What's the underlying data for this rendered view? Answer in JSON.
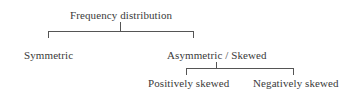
{
  "diagram": {
    "type": "tree",
    "root": {
      "label": "Frequency distribution",
      "children": [
        {
          "label": "Symmetric"
        },
        {
          "label": "Asymmetric / Skewed",
          "children": [
            {
              "label": "Positively skewed"
            },
            {
              "label": "Negatively skewed"
            }
          ]
        }
      ]
    }
  },
  "labels": {
    "root": "Frequency distribution",
    "symmetric": "Symmetric",
    "asymmetric": "Asymmetric / Skewed",
    "positive": "Positively skewed",
    "negative": "Negatively skewed"
  }
}
